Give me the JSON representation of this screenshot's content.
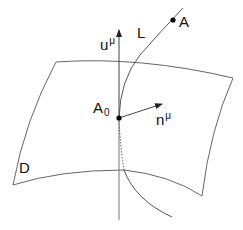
{
  "diagram": {
    "labels": {
      "point_A": "A",
      "curve_L": "L",
      "vector_u_base": "u",
      "vector_u_sup": "μ",
      "point_A0_base": "A",
      "point_A0_sub": "0",
      "vector_n_base": "n",
      "vector_n_sup": "μ",
      "surface_D": "D"
    },
    "elements": [
      {
        "type": "surface",
        "name": "D",
        "shape": "curved quadrilateral"
      },
      {
        "type": "curve",
        "name": "L",
        "passes_through": [
          "A",
          "A0"
        ],
        "below_surface": "dotted"
      },
      {
        "type": "vector",
        "name": "u^μ",
        "origin": "A0",
        "direction": "vertical up"
      },
      {
        "type": "vector",
        "name": "n^μ",
        "origin": "A0",
        "direction": "right, slightly up"
      },
      {
        "type": "point",
        "name": "A0",
        "on": "D"
      },
      {
        "type": "point",
        "name": "A",
        "on": "L"
      }
    ],
    "colors": {
      "stroke": "#555555",
      "point": "#000000"
    }
  }
}
